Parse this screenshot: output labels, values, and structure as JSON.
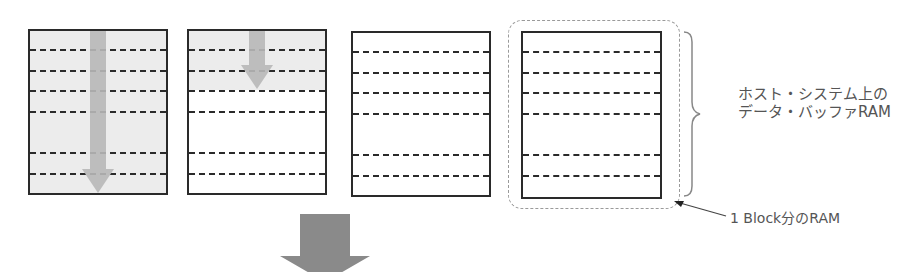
{
  "diagram": {
    "blocks": [
      {
        "id": 1,
        "state": "full",
        "fill_rows": 6
      },
      {
        "id": 2,
        "state": "filling",
        "fill_rows": 3
      },
      {
        "id": 3,
        "state": "empty",
        "fill_rows": 0
      },
      {
        "id": 4,
        "state": "empty",
        "fill_rows": 0,
        "highlighted": true
      }
    ],
    "rows_per_block": 7,
    "labels": {
      "host_buffer_line1": "ホスト・システム上の",
      "host_buffer_line2": "データ・バッファRAM",
      "one_block_ram": "1 Block分のRAM"
    },
    "icons": {
      "fill_arrow": "down-arrow-icon",
      "next_step_arrow": "down-arrow-icon",
      "brace": "curly-brace-icon",
      "pointer": "leader-arrow-icon"
    },
    "colors": {
      "block_border": "#2a2a2a",
      "filled_background": "#ececec",
      "fill_arrow": "#b8b8b8",
      "step_arrow": "#8a8a8a",
      "group_outline": "#9a9a9a",
      "label_text": "#555555"
    }
  }
}
